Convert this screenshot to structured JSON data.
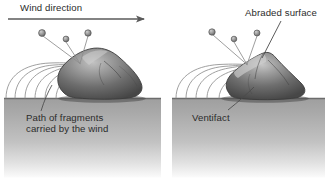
{
  "figure": {
    "width": 329,
    "height": 190,
    "background_color": "#ffffff"
  },
  "labels": {
    "wind_direction": "Wind direction",
    "abraded_surface": "Abraded surface",
    "path_of_fragments_line1": "Path of fragments",
    "path_of_fragments_line2": "carried by the wind",
    "ventifact": "Ventifact"
  },
  "colors": {
    "text": "#2b2b2b",
    "ground_top": "#a8a8a8",
    "ground_bottom": "#f2f2f2",
    "ground_line": "#6f6f6f",
    "rock_light": "#b9b9b9",
    "rock_mid": "#8a8a8a",
    "rock_dark": "#4a4a4a",
    "rock_outline": "#3a3a3a",
    "grain_fill": "#9a9a9a",
    "grain_outline": "#555555",
    "trajectory_line": "#8c8c8c",
    "arrow": "#5a5a5a",
    "leader_line": "#4a4a4a"
  },
  "panels": [
    {
      "id": "before-abrasion",
      "name": "left-panel",
      "caption_label": "path_of_fragments",
      "ground_rect": {
        "x": 4,
        "y": 98,
        "width": 157,
        "height": 80
      },
      "rock": {
        "name": "unabraded-boulder",
        "shape": "rounded",
        "base_y": 98,
        "peak": {
          "x": 98,
          "y": 49
        }
      },
      "grains": [
        {
          "x": 42,
          "y": 33,
          "r": 3.4
        },
        {
          "x": 66,
          "y": 39,
          "r": 2.9
        },
        {
          "x": 88,
          "y": 33,
          "r": 3.2
        }
      ],
      "impact_point": {
        "x": 80,
        "y": 63
      },
      "trajectory_count": 6
    },
    {
      "id": "after-abrasion",
      "name": "right-panel",
      "caption_label": "ventifact",
      "ground_rect": {
        "x": 172,
        "y": 98,
        "width": 153,
        "height": 80
      },
      "rock": {
        "name": "abraded-ventifact",
        "shape": "faceted",
        "base_y": 98,
        "peak": {
          "x": 266,
          "y": 53
        }
      },
      "grains": [
        {
          "x": 212,
          "y": 32,
          "r": 3.2
        },
        {
          "x": 234,
          "y": 39,
          "r": 2.8
        },
        {
          "x": 257,
          "y": 33,
          "r": 3.0
        }
      ],
      "impact_point": {
        "x": 247,
        "y": 64
      },
      "trajectory_count": 5
    }
  ],
  "wind_arrow": {
    "name": "wind-direction-arrow",
    "x1": 8,
    "y1": 19,
    "x2": 145,
    "y2": 19,
    "direction": "left-to-right"
  },
  "leaders": [
    {
      "name": "abraded-surface-leader",
      "from": {
        "x": 281,
        "y": 21
      },
      "to": {
        "x": 262,
        "y": 58
      }
    },
    {
      "name": "path-of-fragments-leader",
      "from": {
        "x": 41,
        "y": 111
      },
      "to": {
        "x": 52,
        "y": 85
      }
    },
    {
      "name": "ventifact-leader",
      "from": {
        "x": 228,
        "y": 110
      },
      "to": {
        "x": 254,
        "y": 87
      }
    }
  ]
}
